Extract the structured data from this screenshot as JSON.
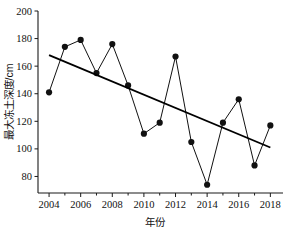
{
  "chart_data": {
    "type": "line",
    "title": "",
    "xlabel": "年份",
    "ylabel": "最大冻土深度/cm",
    "x": [
      2004,
      2005,
      2006,
      2007,
      2008,
      2009,
      2010,
      2011,
      2012,
      2013,
      2014,
      2015,
      2016,
      2017,
      2018
    ],
    "series": [
      {
        "name": "最大冻土深度",
        "values": [
          141,
          174,
          179,
          155,
          176,
          146,
          111,
          119,
          167,
          105,
          74,
          119,
          136,
          88,
          117
        ],
        "marker": "filled-circle",
        "line_color": "#111111"
      },
      {
        "name": "线性趋势线",
        "type": "trendline",
        "endpoints": [
          {
            "x": 2004,
            "y": 168
          },
          {
            "x": 2018,
            "y": 101
          }
        ],
        "line_color": "#000000"
      }
    ],
    "xlim": [
      2003.3,
      2018.8
    ],
    "ylim": [
      68,
      200
    ],
    "xticks": [
      2004,
      2006,
      2008,
      2010,
      2012,
      2014,
      2016,
      2018
    ],
    "xtick_labels": [
      "2004",
      "2006",
      "2008",
      "2010",
      "2012",
      "2014",
      "2016",
      "2018"
    ],
    "x_minor_ticks": [
      2005,
      2007,
      2009,
      2011,
      2013,
      2015,
      2017
    ],
    "yticks": [
      80,
      100,
      120,
      140,
      160,
      180,
      200
    ],
    "ytick_labels": [
      "80",
      "100",
      "120",
      "140",
      "160",
      "180",
      "200"
    ],
    "grid": false,
    "legend": "none"
  }
}
